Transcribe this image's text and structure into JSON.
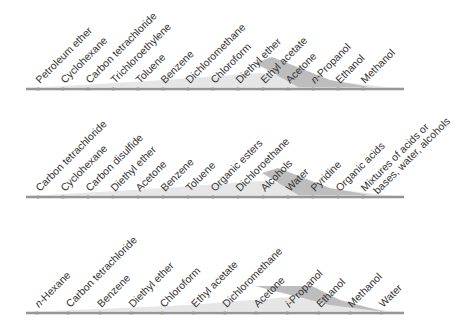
{
  "scales": [
    {
      "id": "scale-1",
      "axis_y": 89,
      "x_start": 26,
      "x_end": 404,
      "first_tick_x": 38,
      "tick_spacing": 25,
      "labels": [
        "Petroleum ether",
        "Cyclohexane",
        "Carbon tetrachloride",
        "Trichloroethylene",
        "Toluene",
        "Benzene",
        "Dichloromethane",
        "Chloroform",
        "Diethyl ether",
        "Ethyl acetate",
        "Acetone",
        "n-Propanol",
        "Ethanol",
        "Methanol"
      ],
      "italic_prefix": {
        "11": "n"
      },
      "wedge_light": "M30,88 L165,80 L260,73 L404,89 Z",
      "wedge_dark": "M255,63 L272,57 L330,80 L375,88 L300,88 Z"
    },
    {
      "id": "scale-2",
      "axis_y": 197,
      "x_start": 26,
      "x_end": 404,
      "first_tick_x": 38,
      "tick_spacing": 25,
      "labels": [
        "Carbon tetrachloride",
        "Cyclohexane",
        "Carbon disulfide",
        "Diethyl ether",
        "Acetone",
        "Benzene",
        "Toluene",
        "Organic esters",
        "Dichloroethane",
        "Alcohols",
        "Water",
        "Pyridine",
        "Organic acids",
        "Mixtures of acids or|bases, water, alcohols"
      ],
      "italic_prefix": {},
      "wedge_light": "M30,196 L165,188 L260,181 L404,197 Z",
      "wedge_dark": "M262,173 L278,168 L330,188 L375,196 L300,196 Z"
    },
    {
      "id": "scale-3",
      "axis_y": 313,
      "x_start": 26,
      "x_end": 404,
      "first_tick_x": 37,
      "tick_spacing": 31.3,
      "labels": [
        "n-Hexane",
        "Carbon tetrachloride",
        "Benzene",
        "Diethyl ether",
        "Chloroform",
        "Ethyl acetate",
        "Dichloromethane",
        "Acetone",
        "i-Propanol",
        "Ethanol",
        "Methanol",
        "Water"
      ],
      "italic_prefix": {
        "0": "n",
        "8": "i"
      },
      "wedge_light": "M30,312 L190,305 L290,297 L404,313 Z",
      "wedge_dark": "M255,286 L312,286 L340,300 L385,312 L330,305 Z"
    }
  ],
  "colors": {
    "text": "#333333",
    "axis": "#555555",
    "tick": "#9a9a9a",
    "wedge_light": "#e6e6e6",
    "wedge_dark": "#bdbdbd"
  }
}
